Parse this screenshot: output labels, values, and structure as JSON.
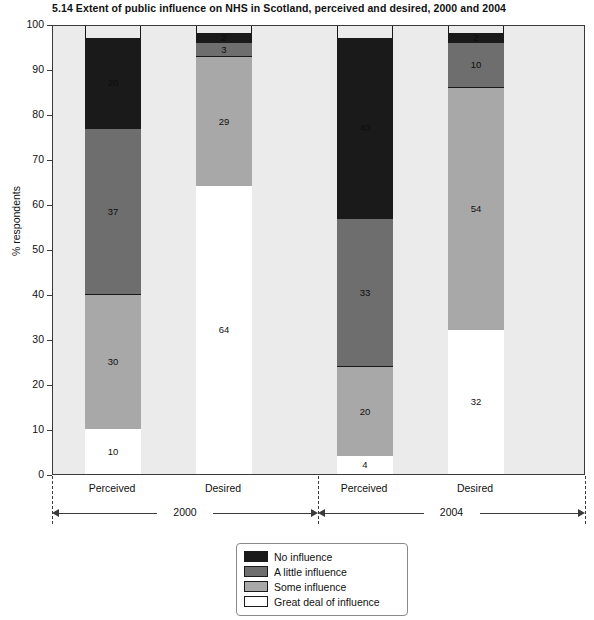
{
  "chart_data": {
    "type": "bar",
    "title": "5.14  Extent of public influence on NHS in Scotland, perceived and desired, 2000 and 2004",
    "xlabel": "",
    "ylabel": "% respondents",
    "ylim": [
      0,
      100
    ],
    "ytick_step": 10,
    "yticks": [
      "100",
      "90",
      "80",
      "70",
      "60",
      "50",
      "40",
      "30",
      "20",
      "10",
      "0"
    ],
    "grid": false,
    "stacked": true,
    "legend_position": "bottom-center",
    "categories": [
      "Perceived",
      "Desired",
      "Perceived",
      "Desired"
    ],
    "groups": [
      {
        "label": "2000",
        "categories": [
          "Perceived",
          "Desired"
        ]
      },
      {
        "label": "2004",
        "categories": [
          "Perceived",
          "Desired"
        ]
      }
    ],
    "series": [
      {
        "name": "Great deal of influence",
        "color": "#ffffff",
        "values": [
          10,
          64,
          4,
          32
        ]
      },
      {
        "name": "Some influence",
        "color": "#a8a8a8",
        "values": [
          30,
          29,
          20,
          54
        ]
      },
      {
        "name": "A little influence",
        "color": "#6e6e6e",
        "values": [
          37,
          3,
          33,
          10
        ]
      },
      {
        "name": "No influence",
        "color": "#1a1a1a",
        "values": [
          20,
          2,
          40,
          2
        ]
      }
    ],
    "bars": [
      {
        "group": "2000",
        "category": "Perceived",
        "segments": [
          {
            "name": "No influence",
            "value": 20,
            "label": "20",
            "color": "#1a1a1a"
          },
          {
            "name": "A little influence",
            "value": 37,
            "label": "37",
            "color": "#6e6e6e"
          },
          {
            "name": "Some influence",
            "value": 30,
            "label": "30",
            "color": "#a8a8a8"
          },
          {
            "name": "Great deal of influence",
            "value": 10,
            "label": "10",
            "color": "#ffffff"
          }
        ]
      },
      {
        "group": "2000",
        "category": "Desired",
        "segments": [
          {
            "name": "No influence",
            "value": 2,
            "label": "2",
            "color": "#1a1a1a"
          },
          {
            "name": "A little influence",
            "value": 3,
            "label": "3",
            "color": "#6e6e6e"
          },
          {
            "name": "Some influence",
            "value": 29,
            "label": "29",
            "color": "#a8a8a8"
          },
          {
            "name": "Great deal of influence",
            "value": 64,
            "label": "64",
            "color": "#ffffff"
          }
        ]
      },
      {
        "group": "2004",
        "category": "Perceived",
        "segments": [
          {
            "name": "No influence",
            "value": 40,
            "label": "40",
            "color": "#1a1a1a"
          },
          {
            "name": "A little influence",
            "value": 33,
            "label": "33",
            "color": "#6e6e6e"
          },
          {
            "name": "Some influence",
            "value": 20,
            "label": "20",
            "color": "#a8a8a8"
          },
          {
            "name": "Great deal of influence",
            "value": 4,
            "label": "4",
            "color": "#ffffff"
          }
        ]
      },
      {
        "group": "2004",
        "category": "Desired",
        "segments": [
          {
            "name": "No influence",
            "value": 2,
            "label": "2",
            "color": "#1a1a1a"
          },
          {
            "name": "A little influence",
            "value": 10,
            "label": "10",
            "color": "#6e6e6e"
          },
          {
            "name": "Some influence",
            "value": 54,
            "label": "54",
            "color": "#a8a8a8"
          },
          {
            "name": "Great deal of influence",
            "value": 32,
            "label": "32",
            "color": "#ffffff"
          }
        ]
      }
    ],
    "legend": [
      {
        "label": "No influence",
        "color": "#1a1a1a"
      },
      {
        "label": "A little influence",
        "color": "#6e6e6e"
      },
      {
        "label": "Some influence",
        "color": "#a8a8a8"
      },
      {
        "label": "Great deal of influence",
        "color": "#ffffff"
      }
    ]
  },
  "colors": {
    "plot_background": "#ebebeb",
    "axis": "#3a3a3a",
    "bar_outline": "#1a1a1a",
    "page_background": "#ffffff",
    "text": "#111111"
  }
}
